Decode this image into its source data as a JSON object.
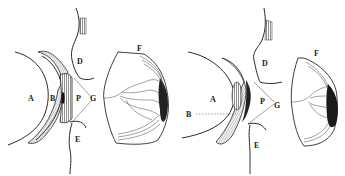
{
  "figure": {
    "left": {
      "labels": {
        "a": "A",
        "b": "B",
        "p": "P",
        "g": "G",
        "d": "D",
        "e": "E",
        "f": "F"
      }
    },
    "right": {
      "labels": {
        "a": "A",
        "b": "B",
        "p": "P",
        "g": "G",
        "d": "D",
        "e": "E",
        "f": "F"
      }
    }
  },
  "colors": {
    "ink": "#2a2a2a",
    "shade": "#555555",
    "dark": "#1a1a1a",
    "paper": "#ffffff"
  }
}
